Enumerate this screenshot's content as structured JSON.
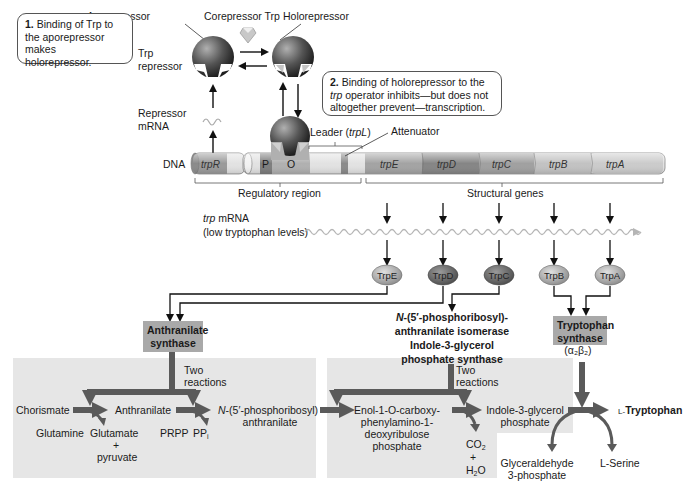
{
  "callouts": {
    "step1": {
      "num": "1.",
      "text": "Binding of Trp to the aporepressor makes holorepressor."
    },
    "step2": {
      "num": "2.",
      "text_a": "Binding of holorepressor to the",
      "text_b_italic": "trp",
      "text_b": "operator inhibits—but does not",
      "text_c": "altogether prevent—transcription."
    }
  },
  "repressor": {
    "aporepressor": "Aporepressor",
    "corepressor": "Corepressor Trp",
    "holorepressor": "Holorepressor",
    "trp_repressor_1": "Trp",
    "trp_repressor_2": "repressor",
    "repressor_mrna_1": "Repressor",
    "repressor_mrna_2": "mRNA"
  },
  "dna": {
    "label": "DNA",
    "leader": "Leader (",
    "leader_italic": "trpL",
    "leader_close": ")",
    "attenuator": "Attenuator",
    "regulatory_region": "Regulatory region",
    "structural_genes": "Structural genes",
    "segments": {
      "trpR": "trpR",
      "P": "P",
      "O": "O",
      "trpE": "trpE",
      "trpD": "trpD",
      "trpC": "trpC",
      "trpB": "trpB",
      "trpA": "trpA"
    }
  },
  "mrna": {
    "label_italic": "trp",
    "label": "mRNA",
    "sublabel": "(low tryptophan levels)"
  },
  "proteins": [
    "TrpE",
    "TrpD",
    "TrpC",
    "TrpB",
    "TrpA"
  ],
  "enzymes": {
    "anthranilate_synthase_1": "Anthranilate",
    "anthranilate_synthase_2": "synthase",
    "isomerase_1_italic": "N",
    "isomerase_1": "-(5′-phosphoribosyl)-",
    "isomerase_2": "anthranilate isomerase",
    "isomerase_3": "Indole-3-glycerol",
    "isomerase_4": "phosphate synthase",
    "trp_synthase_1": "Tryptophan",
    "trp_synthase_2": "synthase",
    "trp_synthase_3": "(α₂β₂)"
  },
  "pathway": {
    "two_reactions_1": "Two",
    "two_reactions_2": "reactions",
    "chorismate": "Chorismate",
    "glutamine": "Glutamine",
    "anthranilate": "Anthranilate",
    "glutamate": "Glutamate",
    "plus": "+",
    "pyruvate": "pyruvate",
    "prpp": "PRPP",
    "ppi": "PP",
    "ppi_sub": "i",
    "npra_italic": "N",
    "npra_1": "-(5′-phosphoribosyl)",
    "npra_2": "anthranilate",
    "cdrp_1": "Enol-1-O-carboxy-",
    "cdrp_2": "phenylamino-1-",
    "cdrp_3": "deoxyribulose",
    "cdrp_4": "phosphate",
    "co2": "CO",
    "co2_sub": "2",
    "h2o_a": "H",
    "h2o_sub": "2",
    "h2o_b": "O",
    "igp_1": "Indole-3-glycerol",
    "igp_2": "phosphate",
    "l_trp_prefix": "L-",
    "l_trp": "Tryptophan",
    "g3p_1": "Glyceraldehyde",
    "g3p_2": "3-phosphate",
    "l_ser": "L-Serine"
  },
  "colors": {
    "panel_bg": "#e6e6e6",
    "enzyme_box": "#a9a9a9",
    "thick_arrow": "#5a5a5a",
    "dna_light": "#e2e2e2",
    "dna_mid": "#b8b8b8",
    "dna_dark": "#8a8a8a",
    "mrna_wave": "#b5b5b5"
  }
}
